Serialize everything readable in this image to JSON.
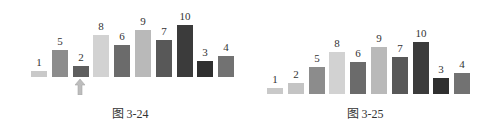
{
  "chart_data": [
    {
      "type": "bar",
      "title": "",
      "caption": "图 3-24",
      "categories": [
        "1",
        "2",
        "3",
        "4",
        "5",
        "6",
        "7",
        "8",
        "9",
        "10"
      ],
      "values": [
        1,
        5,
        2,
        8,
        6,
        9,
        7,
        10,
        3,
        4
      ],
      "labels": [
        "1",
        "5",
        "2",
        "8",
        "6",
        "9",
        "7",
        "10",
        "3",
        "4"
      ],
      "colors": [
        "#c9c9c9",
        "#8c8c8c",
        "#5e5e5e",
        "#d2d2d2",
        "#6b6b6b",
        "#b9b9b9",
        "#585858",
        "#3b3b3b",
        "#2f2f2f",
        "#727272"
      ],
      "highlight_index": 2,
      "annotation": "up-arrow under bar with value 2",
      "xlabel": "",
      "ylabel": "",
      "grid": false,
      "legend": null
    },
    {
      "type": "bar",
      "title": "",
      "caption": "图 3-25",
      "categories": [
        "1",
        "2",
        "3",
        "4",
        "5",
        "6",
        "7",
        "8",
        "9",
        "10"
      ],
      "values": [
        1,
        2,
        5,
        8,
        6,
        9,
        7,
        10,
        3,
        4
      ],
      "labels": [
        "1",
        "2",
        "5",
        "8",
        "6",
        "9",
        "7",
        "10",
        "3",
        "4"
      ],
      "colors": [
        "#c9c9c9",
        "#c4c4c4",
        "#8c8c8c",
        "#d2d2d2",
        "#6b6b6b",
        "#b9b9b9",
        "#585858",
        "#3b3b3b",
        "#2f2f2f",
        "#727272"
      ],
      "xlabel": "",
      "ylabel": "",
      "grid": false,
      "legend": null
    }
  ],
  "figures": {
    "left": {
      "caption": "图 3-24",
      "arrow_color": "#bdbdbd"
    },
    "right": {
      "caption": "图 3-25"
    }
  }
}
